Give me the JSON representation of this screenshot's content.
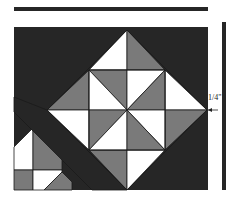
{
  "figure": {
    "type": "quilt-block-diagram",
    "measurement_label": "1/4\"",
    "colors": {
      "dark": "#262626",
      "gray": "#7a7a7a",
      "white": "#ffffff",
      "line": "#1a1a1a"
    }
  },
  "geometry": {
    "top_bar": {
      "x": 14,
      "y": 7,
      "w": 194,
      "h": 4
    },
    "vertical_bar": {
      "x": 222,
      "y": 22,
      "w": 4,
      "h": 168
    },
    "block_frame": {
      "x": 14,
      "y": 27,
      "w": 194,
      "h": 163
    },
    "diamond": {
      "cx": 127,
      "cy": 110,
      "half": 80
    },
    "inner_square": {
      "x": 89,
      "y": 70,
      "size": 76
    }
  }
}
